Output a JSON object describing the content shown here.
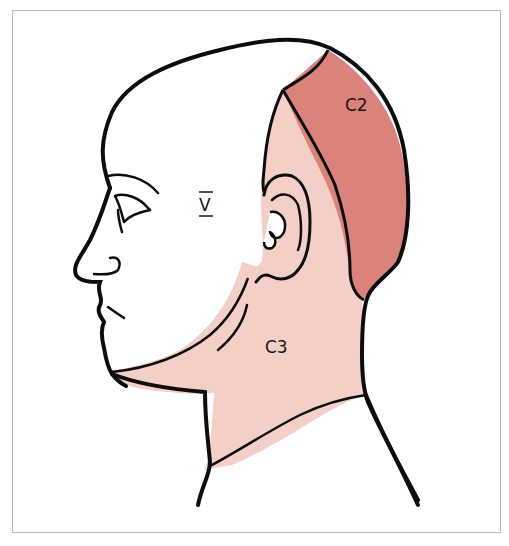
{
  "figure": {
    "regions": [
      {
        "id": "V",
        "label": "V",
        "decoration": "overline-underline",
        "fill": "#ffffff",
        "description": "trigeminal face/scalp region"
      },
      {
        "id": "C2",
        "label": "C2",
        "fill": "#d9837a"
      },
      {
        "id": "C3",
        "label": "C3",
        "fill": "#f4cfc7"
      }
    ],
    "colors": {
      "outline": "#0d0d0d",
      "frame": "#b8b8b8",
      "background": "#ffffff",
      "c2": "#d9837a",
      "c3": "#f4cfc7"
    }
  }
}
